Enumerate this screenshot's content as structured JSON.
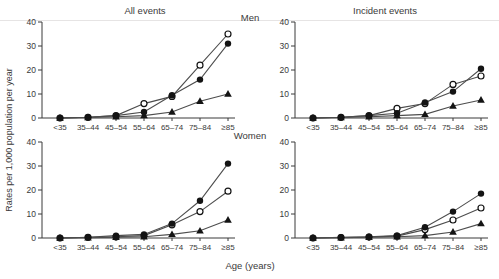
{
  "figure": {
    "ylabel": "Rates per 1,000 population per year",
    "xlabel": "Age (years)",
    "column_titles": {
      "left": "All events",
      "right": "Incident events"
    },
    "row_titles": {
      "top": "Men",
      "bottom": "Women"
    },
    "colors": {
      "line": "#4d4d4d",
      "marker": "#141414",
      "axis": "#3a3a3a",
      "open_marker_fill": "#ffffff"
    }
  },
  "chart_data": [
    {
      "type": "line",
      "panel": "all-events-men",
      "column": "All events",
      "row": "Men",
      "categories": [
        "<35",
        "35–44",
        "45–54",
        "55–64",
        "65–74",
        "75–84",
        "≥85"
      ],
      "ylim": [
        0,
        40
      ],
      "yticks": [
        0,
        10,
        20,
        30,
        40
      ],
      "grid": false,
      "legend": "none",
      "series": [
        {
          "name": "open-circle-series",
          "marker": "open-circle",
          "values": [
            0,
            0.3,
            1,
            6,
            9,
            22,
            35
          ]
        },
        {
          "name": "filled-circle-series",
          "marker": "filled-circle",
          "values": [
            0,
            0.3,
            1,
            2.5,
            9.5,
            16,
            31
          ]
        },
        {
          "name": "filled-triangle-series",
          "marker": "filled-triangle",
          "values": [
            0,
            0.2,
            0.5,
            1,
            2.5,
            7,
            10
          ]
        }
      ]
    },
    {
      "type": "line",
      "panel": "incident-events-men",
      "column": "Incident events",
      "row": "Men",
      "categories": [
        "<35",
        "35–44",
        "45–54",
        "55–64",
        "65–74",
        "75–84",
        "≥85"
      ],
      "ylim": [
        0,
        40
      ],
      "yticks": [
        0,
        10,
        20,
        30,
        40
      ],
      "grid": false,
      "legend": "none",
      "series": [
        {
          "name": "open-circle-series",
          "marker": "open-circle",
          "values": [
            0,
            0.3,
            1,
            4,
            6,
            14,
            17.5
          ]
        },
        {
          "name": "filled-circle-series",
          "marker": "filled-circle",
          "values": [
            0,
            0.3,
            1,
            2,
            6.5,
            11,
            20.5
          ]
        },
        {
          "name": "filled-triangle-series",
          "marker": "filled-triangle",
          "values": [
            0,
            0.2,
            0.5,
            1,
            1.5,
            5,
            7.5
          ]
        }
      ]
    },
    {
      "type": "line",
      "panel": "all-events-women",
      "column": "All events",
      "row": "Women",
      "categories": [
        "<35",
        "35–44",
        "45–54",
        "55–64",
        "65–74",
        "75–84",
        "≥85"
      ],
      "ylim": [
        0,
        40
      ],
      "yticks": [
        0,
        10,
        20,
        30,
        40
      ],
      "grid": false,
      "legend": "none",
      "series": [
        {
          "name": "open-circle-series",
          "marker": "open-circle",
          "values": [
            0,
            0.3,
            0.5,
            1,
            5.5,
            11,
            19.5
          ]
        },
        {
          "name": "filled-circle-series",
          "marker": "filled-circle",
          "values": [
            0,
            0.3,
            1,
            1.5,
            6,
            15.5,
            31
          ]
        },
        {
          "name": "filled-triangle-series",
          "marker": "filled-triangle",
          "values": [
            0,
            0.1,
            0.3,
            0.5,
            1.5,
            3,
            7.5
          ]
        }
      ]
    },
    {
      "type": "line",
      "panel": "incident-events-women",
      "column": "Incident events",
      "row": "Women",
      "categories": [
        "<35",
        "35–44",
        "45–54",
        "55–64",
        "65–74",
        "75–84",
        "≥85"
      ],
      "ylim": [
        0,
        40
      ],
      "yticks": [
        0,
        10,
        20,
        30,
        40
      ],
      "grid": false,
      "legend": "none",
      "series": [
        {
          "name": "open-circle-series",
          "marker": "open-circle",
          "values": [
            0,
            0.2,
            0.4,
            0.8,
            3.5,
            7.5,
            12.5
          ]
        },
        {
          "name": "filled-circle-series",
          "marker": "filled-circle",
          "values": [
            0,
            0.3,
            0.5,
            1,
            4.5,
            11,
            18.5
          ]
        },
        {
          "name": "filled-triangle-series",
          "marker": "filled-triangle",
          "values": [
            0,
            0.1,
            0.3,
            0.5,
            1,
            2.5,
            6
          ]
        }
      ]
    }
  ]
}
